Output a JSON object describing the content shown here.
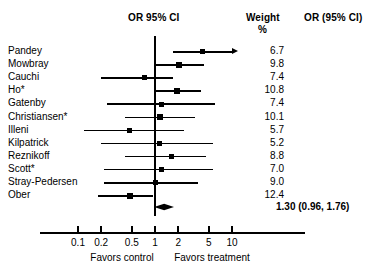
{
  "header": {
    "or_ci_label": "OR  95% CI",
    "weight_label": "Weight",
    "percent_label": "%",
    "or_ci_right_label": "OR (95% CI)"
  },
  "summary": {
    "text": "1.30 (0.96, 1.76)",
    "or": 1.3,
    "lower": 0.96,
    "upper": 1.76
  },
  "axis": {
    "ticks": [
      "0.1",
      "0.2",
      "0.5",
      "1",
      "2",
      "5",
      "10"
    ],
    "tick_values": [
      0.1,
      0.2,
      0.5,
      1,
      2,
      5,
      10
    ],
    "left_caption": "Favors control",
    "right_caption": "Favors treatment",
    "scale": "log"
  },
  "studies": [
    {
      "name": "Pandey",
      "weight": "6.7",
      "or": 4.1,
      "lower": 1.7,
      "upper": 12.0,
      "truncated_upper": true
    },
    {
      "name": "Mowbray",
      "weight": "9.8",
      "or": 2.05,
      "lower": 1.0,
      "upper": 4.35
    },
    {
      "name": "Cauchi",
      "weight": "7.4",
      "or": 0.72,
      "lower": 0.2,
      "upper": 1.7
    },
    {
      "name": "Ho*",
      "weight": "10.8",
      "or": 1.95,
      "lower": 1.0,
      "upper": 3.95
    },
    {
      "name": "Gatenby",
      "weight": "7.4",
      "or": 1.2,
      "lower": 0.24,
      "upper": 6.0
    },
    {
      "name": "Christiansen*",
      "weight": "10.1",
      "or": 1.16,
      "lower": 0.41,
      "upper": 3.3
    },
    {
      "name": "Illeni",
      "weight": "5.7",
      "or": 0.46,
      "lower": 0.12,
      "upper": 2.35
    },
    {
      "name": "Kilpatrick",
      "weight": "5.2",
      "or": 1.16,
      "lower": 0.2,
      "upper": 5.6
    },
    {
      "name": "Reznikoff",
      "weight": "8.8",
      "or": 1.65,
      "lower": 0.41,
      "upper": 4.6
    },
    {
      "name": "Scott*",
      "weight": "7.0",
      "or": 1.22,
      "lower": 0.22,
      "upper": 5.6
    },
    {
      "name": "Stray-Pedersen",
      "weight": "9.0",
      "or": 1.0,
      "lower": 0.22,
      "upper": 3.6
    },
    {
      "name": "Ober",
      "weight": "12.4",
      "or": 0.48,
      "lower": 0.18,
      "upper": 0.94
    }
  ],
  "chart_data": {
    "type": "forest",
    "title": "",
    "xlabel": "",
    "ylabel": "",
    "xscale": "log",
    "xlim": [
      0.08,
      14
    ],
    "xticks": [
      0.1,
      0.2,
      0.5,
      1,
      2,
      5,
      10
    ],
    "xticklabels": [
      "0.1",
      "0.2",
      "0.5",
      "1",
      "2",
      "5",
      "10"
    ],
    "reference_line": 1,
    "grid": false,
    "legend": null,
    "annotations": [
      "Favors control",
      "Favors treatment"
    ],
    "columns": [
      "Study",
      "OR  95% CI",
      "Weight %",
      "OR (95% CI)"
    ],
    "categories": [
      "Pandey",
      "Mowbray",
      "Cauchi",
      "Ho*",
      "Gatenby",
      "Christiansen*",
      "Illeni",
      "Kilpatrick",
      "Reznikoff",
      "Scott*",
      "Stray-Pedersen",
      "Ober"
    ],
    "values": [
      4.1,
      2.05,
      0.72,
      1.95,
      1.2,
      1.16,
      0.46,
      1.16,
      1.65,
      1.22,
      1.0,
      0.48
    ],
    "ci_lower": [
      1.7,
      1.0,
      0.2,
      1.0,
      0.24,
      0.41,
      0.12,
      0.2,
      0.41,
      0.22,
      0.22,
      0.18
    ],
    "ci_upper": [
      12.0,
      4.35,
      1.7,
      3.95,
      6.0,
      3.3,
      2.35,
      5.6,
      4.6,
      5.6,
      3.6,
      0.94
    ],
    "weights": [
      6.7,
      9.8,
      7.4,
      10.8,
      7.4,
      10.1,
      5.7,
      5.2,
      8.8,
      7.0,
      9.0,
      12.4
    ],
    "overall": {
      "label": "1.30 (0.96, 1.76)",
      "or": 1.3,
      "ci_lower": 0.96,
      "ci_upper": 1.76
    }
  }
}
